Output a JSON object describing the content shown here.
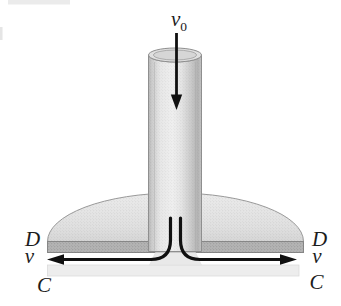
{
  "diagram": {
    "labels": {
      "v0_base": "v",
      "v0_sub": "0",
      "diameter": "D",
      "velocity": "v",
      "contour": "C"
    },
    "colors": {
      "background": "#ffffff",
      "flow_line": "#101010",
      "outline": "#8f8f8f",
      "band_fill": "#b3b3b3",
      "band_edge": "#878787",
      "plate_fill": "#ededed",
      "plate_edge": "#d9d9d9",
      "dome_edge": "#9a9a9a",
      "rim_fill": "#e0e0e0",
      "opening_fill": "#d6d6d6",
      "spread_fill": "#e9e9e9"
    }
  }
}
